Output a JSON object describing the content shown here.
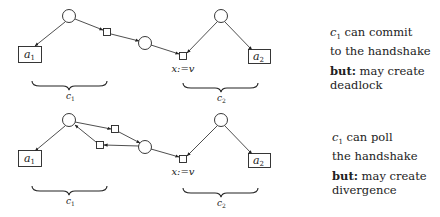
{
  "diagrams": [
    {
      "name": "commit",
      "nodes": {
        "a1": {
          "label": "a",
          "sub": "1"
        },
        "a2": {
          "label": "a",
          "sub": "2"
        },
        "assign": {
          "label": "x:=v"
        }
      },
      "braces": [
        {
          "label": "c",
          "sub": "1"
        },
        {
          "label": "c",
          "sub": "2"
        }
      ],
      "note": {
        "line1_var": "c",
        "line1_sub": "1",
        "line1_rest": " can commit",
        "line2": "to the handshake",
        "but": "but:",
        "line3_rest": " may create",
        "line4": "deadlock"
      }
    },
    {
      "name": "poll",
      "nodes": {
        "a1": {
          "label": "a",
          "sub": "1"
        },
        "a2": {
          "label": "a",
          "sub": "2"
        },
        "assign": {
          "label": "x:=v"
        }
      },
      "braces": [
        {
          "label": "c",
          "sub": "1"
        },
        {
          "label": "c",
          "sub": "2"
        }
      ],
      "note": {
        "line1_var": "c",
        "line1_sub": "1",
        "line1_rest": " can poll",
        "line2": "the handshake",
        "but": "but:",
        "line3_rest": " may create",
        "line4": "divergence"
      }
    }
  ]
}
